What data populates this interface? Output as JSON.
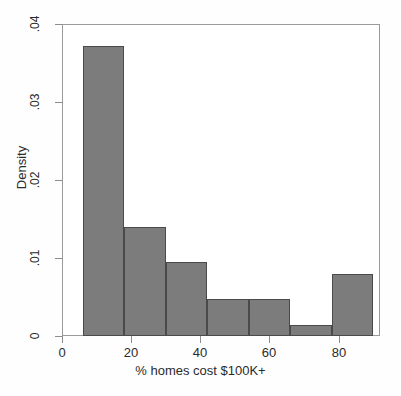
{
  "chart_data": {
    "type": "bar",
    "title": "",
    "subtitle": "",
    "xlabel": "% homes cost $100K+",
    "ylabel": "Density",
    "xlim": [
      0,
      92
    ],
    "ylim": [
      0,
      0.04
    ],
    "grid": false,
    "legend": null,
    "bin_edges": [
      6,
      18,
      30,
      42,
      54,
      66,
      78,
      90
    ],
    "bin_width": 12,
    "categories": [
      "6-18",
      "18-30",
      "30-42",
      "42-54",
      "54-66",
      "66-78",
      "78-90"
    ],
    "values": [
      0.0372,
      0.014,
      0.0095,
      0.0047,
      0.0047,
      0.0014,
      0.0079
    ],
    "bar_color": "#7c7c7c",
    "bar_edge_color": "#4a4a4a",
    "xticks": [
      0,
      20,
      40,
      60,
      80
    ],
    "xtick_labels": [
      "0",
      "20",
      "40",
      "60",
      "80"
    ],
    "yticks": [
      0,
      0.01,
      0.02,
      0.03,
      0.04
    ],
    "ytick_labels": [
      "0",
      ".01",
      ".02",
      ".03",
      ".04"
    ]
  },
  "axes": {
    "x": {
      "title": "% homes cost $100K+",
      "ticks": [
        {
          "value": 0,
          "label": "0"
        },
        {
          "value": 20,
          "label": "20"
        },
        {
          "value": 40,
          "label": "40"
        },
        {
          "value": 60,
          "label": "60"
        },
        {
          "value": 80,
          "label": "80"
        }
      ]
    },
    "y": {
      "title": "Density",
      "ticks": [
        {
          "value": 0.04,
          "label": ".04"
        },
        {
          "value": 0.03,
          "label": ".03"
        },
        {
          "value": 0.02,
          "label": ".02"
        },
        {
          "value": 0.01,
          "label": ".01"
        },
        {
          "value": 0,
          "label": "0"
        }
      ]
    }
  }
}
